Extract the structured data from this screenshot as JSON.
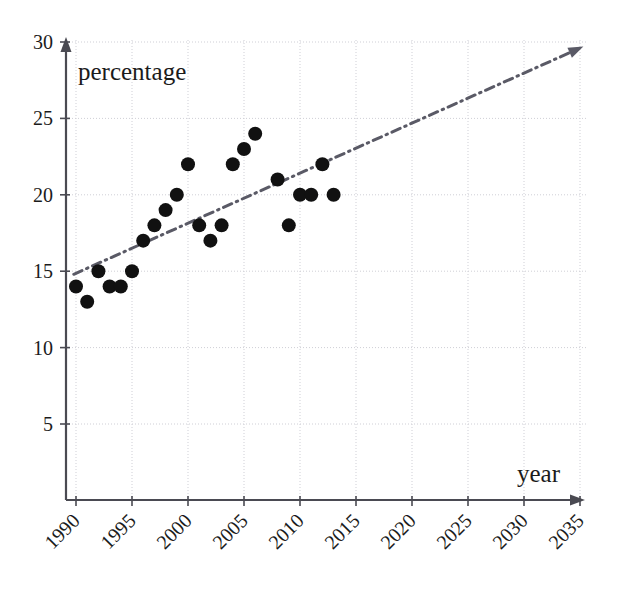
{
  "chart_data": {
    "type": "scatter",
    "title": "",
    "subtitle": "",
    "xlabel": "year",
    "ylabel": "percentage",
    "xlim": [
      1989,
      2036.5
    ],
    "ylim": [
      0,
      30
    ],
    "grid": true,
    "legend": false,
    "legend_position": "none",
    "x_ticks": [
      1990,
      1995,
      2000,
      2005,
      2010,
      2015,
      2020,
      2025,
      2030,
      2035
    ],
    "x_tick_labels": [
      "1990",
      "1995",
      "2000",
      "2005",
      "2010",
      "2015",
      "2020",
      "2025",
      "2030",
      "2035"
    ],
    "x_tick_rotation": 45,
    "y_ticks": [
      5,
      10,
      15,
      20,
      25,
      30
    ],
    "y_tick_labels": [
      "5",
      "10",
      "15",
      "20",
      "25",
      "30"
    ],
    "marker_color": "#111111",
    "marker_shape": "circle",
    "marker_radius": 7,
    "series": [
      {
        "name": "data",
        "x": [
          1990,
          1991,
          1992,
          1993,
          1994,
          1995,
          1996,
          1997,
          1998,
          1999,
          2000,
          2001,
          2002,
          2003,
          2004,
          2005,
          2006,
          2008,
          2009,
          2010,
          2011,
          2012,
          2013
        ],
        "y": [
          14,
          13,
          15,
          14,
          14,
          15,
          17,
          18,
          19,
          20,
          22,
          18,
          17,
          18,
          22,
          23,
          24,
          21,
          18,
          20,
          20,
          22,
          20
        ]
      }
    ],
    "trendline": {
      "name": "trend",
      "style": "dash-dot",
      "color": "#5a5a66",
      "width": 3,
      "arrow_end": true,
      "x_start": 1989.8,
      "y_start": 14.8,
      "x_end": 2035.3,
      "y_end": 29.7
    },
    "axis_color": "#4a4a52",
    "grid_color": "#cfcfd6",
    "axis_arrows": {
      "x": true,
      "y": true
    }
  },
  "labels": {
    "y_axis_title": "percentage",
    "x_axis_title": "year"
  }
}
